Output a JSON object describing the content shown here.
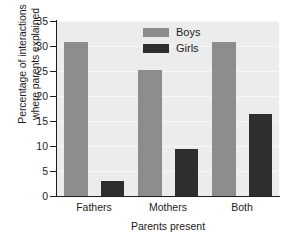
{
  "chart_data": {
    "type": "bar",
    "title": "",
    "xlabel": "Parents present",
    "ylabel": "Percentage of interactions where parents explained",
    "ylabel_lines": [
      "Percentage of interactions",
      "where parents explained"
    ],
    "categories": [
      "Fathers",
      "Mothers",
      "Both"
    ],
    "series": [
      {
        "name": "Boys",
        "color": "#8d8d8d",
        "values": [
          30.8,
          25.3,
          30.8
        ]
      },
      {
        "name": "Girls",
        "color": "#2e2e2e",
        "values": [
          3.0,
          9.4,
          16.4
        ]
      }
    ],
    "ylim": [
      0,
      35
    ],
    "ytick_values": [
      0,
      5,
      10,
      15,
      20,
      25,
      30,
      35
    ],
    "ytick_labels": [
      "0",
      "5",
      "10",
      "15",
      "20",
      "25",
      "30",
      "35"
    ],
    "grid": true,
    "grid_axis": "y",
    "legend_position": "top-center-inside",
    "plot_background": "#ececec",
    "figure_background": "#ffffff",
    "axis_color": "#1c1c1c"
  }
}
